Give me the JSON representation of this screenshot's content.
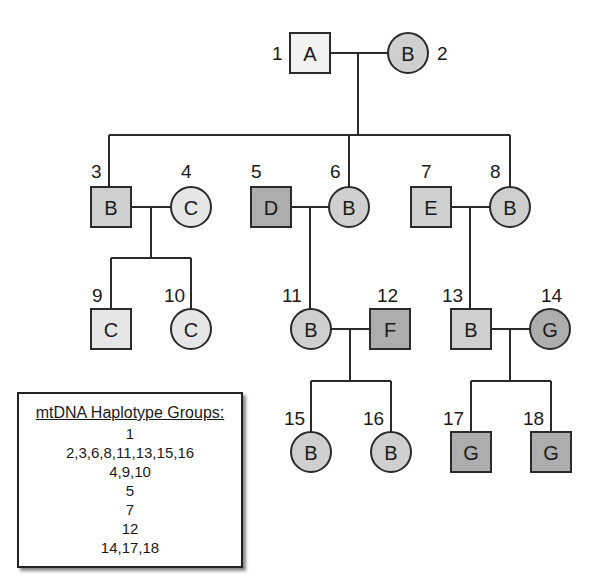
{
  "colors": {
    "white_fill": "#f2f2f2",
    "light_fill": "#e6e6e6",
    "medium_fill": "#cfcfcf",
    "dark_fill": "#adadad",
    "stroke": "#2a2a2a"
  },
  "individuals": [
    {
      "id": 1,
      "num": "1",
      "sex": "male",
      "label": "A",
      "shade": "white"
    },
    {
      "id": 2,
      "num": "2",
      "sex": "female",
      "label": "B",
      "shade": "medium"
    },
    {
      "id": 3,
      "num": "3",
      "sex": "male",
      "label": "B",
      "shade": "medium"
    },
    {
      "id": 4,
      "num": "4",
      "sex": "female",
      "label": "C",
      "shade": "light"
    },
    {
      "id": 5,
      "num": "5",
      "sex": "male",
      "label": "D",
      "shade": "dark"
    },
    {
      "id": 6,
      "num": "6",
      "sex": "female",
      "label": "B",
      "shade": "medium"
    },
    {
      "id": 7,
      "num": "7",
      "sex": "male",
      "label": "E",
      "shade": "medium"
    },
    {
      "id": 8,
      "num": "8",
      "sex": "female",
      "label": "B",
      "shade": "medium"
    },
    {
      "id": 9,
      "num": "9",
      "sex": "male",
      "label": "C",
      "shade": "light"
    },
    {
      "id": 10,
      "num": "10",
      "sex": "female",
      "label": "C",
      "shade": "light"
    },
    {
      "id": 11,
      "num": "11",
      "sex": "female",
      "label": "B",
      "shade": "medium"
    },
    {
      "id": 12,
      "num": "12",
      "sex": "male",
      "label": "F",
      "shade": "dark"
    },
    {
      "id": 13,
      "num": "13",
      "sex": "male",
      "label": "B",
      "shade": "medium"
    },
    {
      "id": 14,
      "num": "14",
      "sex": "female",
      "label": "G",
      "shade": "dark"
    },
    {
      "id": 15,
      "num": "15",
      "sex": "female",
      "label": "B",
      "shade": "medium"
    },
    {
      "id": 16,
      "num": "16",
      "sex": "female",
      "label": "B",
      "shade": "medium"
    },
    {
      "id": 17,
      "num": "17",
      "sex": "male",
      "label": "G",
      "shade": "dark"
    },
    {
      "id": 18,
      "num": "18",
      "sex": "male",
      "label": "G",
      "shade": "dark"
    }
  ],
  "legend": {
    "title": "mtDNA Haplotype Groups:",
    "groups": [
      "1",
      "2,3,6,8,11,13,15,16",
      "4,9,10",
      "5",
      "7",
      "12",
      "14,17,18"
    ]
  }
}
